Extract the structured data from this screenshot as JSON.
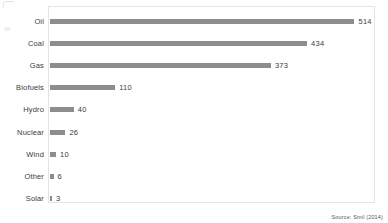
{
  "chart_data": {
    "type": "bar",
    "orientation": "horizontal",
    "title": "",
    "subtitle": "",
    "xlabel": "",
    "ylabel": "",
    "categories": [
      "Oil",
      "Coal",
      "Gas",
      "Biofuels",
      "Hydro",
      "Nuclear",
      "Wind",
      "Other",
      "Solar"
    ],
    "values": [
      514,
      434,
      373,
      110,
      40,
      26,
      10,
      6,
      3
    ],
    "data_labels": [
      "514",
      "434",
      "373",
      "110",
      "40",
      "26",
      "10",
      "6",
      "3"
    ],
    "xlim": [
      0,
      515
    ],
    "ylim": null,
    "grid": false,
    "legend": null,
    "legend_position": "none",
    "bar_color": "#8d8d8d",
    "frame_color": "#e4e4e4",
    "text_color": "#3b3b3b",
    "annotations": [
      "Source: Smil (2014)"
    ]
  },
  "figure": {
    "source_note": "Source: Smil (2014)"
  },
  "artifacts": {
    "smudge": "ink-smudge-mark",
    "corner": "page-corner-mark"
  }
}
